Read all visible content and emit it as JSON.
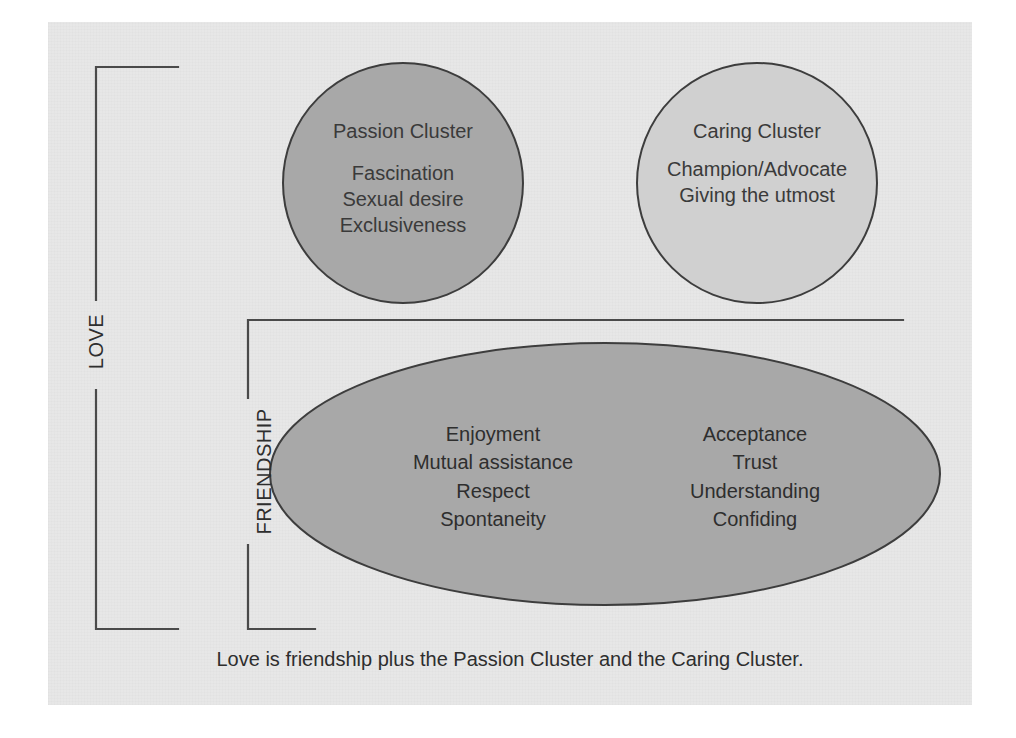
{
  "figure": {
    "caption": "Love is friendship plus the Passion Cluster and the Caring Cluster.",
    "background_color": "#ffffff",
    "card_color": "#e7e7e7",
    "line_color": "#4a4a4a",
    "text_color": "#2e2e2e"
  },
  "brackets": {
    "love": {
      "label": "LOVE"
    },
    "friendship": {
      "label": "FRIENDSHIP"
    }
  },
  "clusters": {
    "passion": {
      "title": "Passion Cluster",
      "fill_color": "#a8a8a8",
      "items": [
        "Fascination",
        "Sexual desire",
        "Exclusiveness"
      ],
      "items_text": "Fascination\nSexual desire\nExclusiveness"
    },
    "caring": {
      "title": "Caring Cluster",
      "fill_color": "#d0d0d0",
      "items": [
        "Champion/Advocate",
        "Giving the utmost"
      ],
      "items_text": "Champion/Advocate\nGiving the utmost"
    }
  },
  "friendship_ellipse": {
    "fill_color": "#a8a8a8",
    "left_column": [
      "Enjoyment",
      "Mutual assistance",
      "Respect",
      "Spontaneity"
    ],
    "right_column": [
      "Acceptance",
      "Trust",
      "Understanding",
      "Confiding"
    ],
    "left_column_text": "Enjoyment\nMutual assistance\nRespect\nSpontaneity",
    "right_column_text": "Acceptance\nTrust\nUnderstanding\nConfiding"
  }
}
